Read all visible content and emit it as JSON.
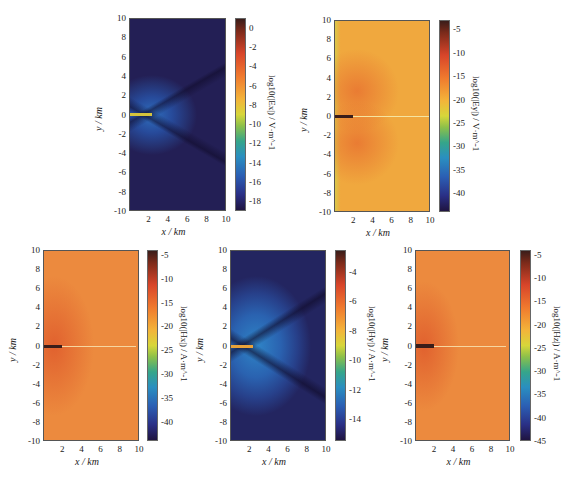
{
  "chart_data": [
    {
      "type": "heatmap",
      "title": "",
      "xlabel": "x / km",
      "ylabel": "y / km",
      "colorbar_label": "log10(|Ex|) / V·m^-1",
      "xlim": [
        0,
        10
      ],
      "ylim": [
        -10,
        10
      ],
      "x_ticks": [
        "2",
        "4",
        "6",
        "8",
        "10"
      ],
      "y_ticks": [
        "10",
        "8",
        "6",
        "4",
        "2",
        "0",
        "-2",
        "-4",
        "-6",
        "-8",
        "-10"
      ],
      "colorbar_ticks": [
        "0",
        "-2",
        "-4",
        "-6",
        "-8",
        "-10",
        "-12",
        "-14",
        "-16",
        "-18"
      ],
      "colorbar_range": [
        -19,
        1
      ],
      "description": "Dark blue field (~-17); strong source along y=0 from x=0 to 2 km (~-6 yellow); light blue halo near x=2; dark V-shaped minimum lines from (2,0) diverging to right"
    },
    {
      "type": "heatmap",
      "xlabel": "x / km",
      "ylabel": "y / km",
      "colorbar_label": "log10(|Ey|) / V·m^-1",
      "xlim": [
        0,
        10
      ],
      "ylim": [
        -10,
        10
      ],
      "x_ticks": [
        "2",
        "4",
        "6",
        "8",
        "10"
      ],
      "y_ticks": [
        "10",
        "8",
        "6",
        "4",
        "2",
        "0",
        "-2",
        "-4",
        "-6",
        "-8",
        "-10"
      ],
      "colorbar_ticks": [
        "-5",
        "-10",
        "-15",
        "-20",
        "-25",
        "-30",
        "-35",
        "-40"
      ],
      "colorbar_range": [
        -44,
        -3
      ],
      "description": "Orange field (~-14) with two circular lobes above/below y=0 centered near x=2-3; dark line along y=0 for x<2; light line along y=0 to x=10; yellow-green edges at left"
    },
    {
      "type": "heatmap",
      "xlabel": "x / km",
      "ylabel": "y / km",
      "colorbar_label": "log10(|Hx|) / A·m^-1",
      "xlim": [
        0,
        10
      ],
      "ylim": [
        -10,
        10
      ],
      "x_ticks": [
        "2",
        "4",
        "6",
        "8",
        "10"
      ],
      "y_ticks": [
        "10",
        "8",
        "6",
        "4",
        "2",
        "0",
        "-2",
        "-4",
        "-6",
        "-8",
        "-10"
      ],
      "colorbar_ticks": [
        "-5",
        "-10",
        "-15",
        "-20",
        "-25",
        "-30",
        "-35",
        "-40"
      ],
      "colorbar_range": [
        -44,
        -4
      ],
      "description": "Orange field (~-12); redder near source x<3; dark line along y=0 for x<2; light line along y=0 to x=10"
    },
    {
      "type": "heatmap",
      "xlabel": "x / km",
      "ylabel": "y / km",
      "colorbar_label": "log10(|Hy|) / A·m^-1",
      "xlim": [
        0,
        10
      ],
      "ylim": [
        -10,
        10
      ],
      "x_ticks": [
        "2",
        "4",
        "6",
        "8",
        "10"
      ],
      "y_ticks": [
        "10",
        "8",
        "6",
        "4",
        "2",
        "0",
        "-2",
        "-4",
        "-6",
        "-8",
        "-10"
      ],
      "colorbar_ticks": [
        "-4",
        "-6",
        "-8",
        "-10",
        "-12",
        "-14"
      ],
      "colorbar_range": [
        -15.5,
        -2.5
      ],
      "description": "Blue field (~-12); source along y=0 x=0-2 (~-7 orange/yellow); dark V-shaped minimum lines from (2,0) diverging"
    },
    {
      "type": "heatmap",
      "xlabel": "x / km",
      "ylabel": "y / km",
      "colorbar_label": "log10(|Hz|) / A·m^-1",
      "xlim": [
        0,
        10
      ],
      "ylim": [
        -10,
        10
      ],
      "x_ticks": [
        "2",
        "4",
        "6",
        "8",
        "10"
      ],
      "y_ticks": [
        "10",
        "8",
        "6",
        "4",
        "2",
        "0",
        "-2",
        "-4",
        "-6",
        "-8",
        "-10"
      ],
      "colorbar_ticks": [
        "-5",
        "-10",
        "-15",
        "-20",
        "-25",
        "-30",
        "-35",
        "-40",
        "-45"
      ],
      "colorbar_range": [
        -45,
        -4
      ],
      "description": "Orange field (~-12); redder near source; dark line along y=0 for x<2; light line along y=0 to x=10"
    }
  ],
  "labels": {
    "x": "x / km",
    "y": "y / km"
  },
  "colors": {
    "dark_blue": "#25225e",
    "mid_blue": "#2a62b0",
    "orange": "#ee8a3c",
    "red_orange": "#e0582c",
    "yellow": "#d8c83a",
    "dark_red": "#3a1d1a"
  }
}
